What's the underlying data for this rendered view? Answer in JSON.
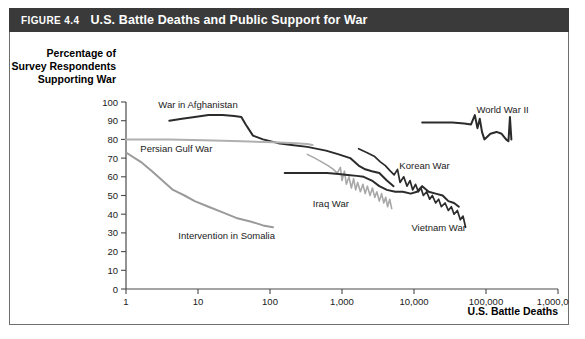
{
  "figure": {
    "number": "FIGURE 4.4",
    "title": "U.S. Battle Deaths and Public Support for War"
  },
  "chart_data": {
    "type": "line",
    "title": "U.S. Battle Deaths and Public Support for War",
    "xlabel": "U.S. Battle Deaths",
    "ylabel": "Percentage of Survey Respondents Supporting War",
    "ylabel_lines": [
      "Percentage of",
      "Survey Respondents",
      "Supporting War"
    ],
    "xscale": "log",
    "xlim": [
      1,
      1000000
    ],
    "ylim": [
      0,
      100
    ],
    "grid": false,
    "legend": "inline-annotations",
    "xticks": [
      1,
      10,
      100,
      1000,
      10000,
      100000,
      1000000
    ],
    "xtick_labels": [
      "1",
      "10",
      "100",
      "1,000",
      "10,000",
      "100,000",
      "1,000,000"
    ],
    "yticks": [
      0,
      10,
      20,
      30,
      40,
      50,
      60,
      70,
      80,
      90,
      100
    ],
    "ytick_labels": [
      "0",
      "10",
      "20",
      "30",
      "40",
      "50",
      "60",
      "70",
      "80",
      "90",
      "100"
    ],
    "series": [
      {
        "name": "War in Afghanistan",
        "color": "#2b2b2b",
        "width": 2.0,
        "label_x": 10,
        "label_y": 97,
        "points": [
          [
            4.0,
            90
          ],
          [
            6.0,
            91
          ],
          [
            9.0,
            92
          ],
          [
            14.0,
            93
          ],
          [
            22.0,
            93
          ],
          [
            32.0,
            92.5
          ],
          [
            40.0,
            92
          ],
          [
            46.0,
            88
          ],
          [
            58.0,
            82
          ],
          [
            80.0,
            80
          ],
          [
            130.0,
            78
          ],
          [
            200.0,
            77
          ],
          [
            330.0,
            76
          ],
          [
            600.0,
            74
          ],
          [
            900.0,
            72
          ],
          [
            1300.0,
            70
          ],
          [
            1700.0,
            66
          ],
          [
            2100.0,
            64
          ],
          [
            2600.0,
            63
          ],
          [
            3300.0,
            62
          ],
          [
            4200.0,
            58
          ],
          [
            5200.0,
            55
          ]
        ]
      },
      {
        "name": "Persian Gulf War",
        "color": "#b0b0b0",
        "width": 2.0,
        "label_x": 5,
        "label_y": 73,
        "points": [
          [
            1.0,
            80
          ],
          [
            4.0,
            80
          ],
          [
            12.0,
            79.5
          ],
          [
            40.0,
            79
          ],
          [
            110.0,
            78.5
          ],
          [
            230.0,
            78
          ],
          [
            330.0,
            77.5
          ],
          [
            390.0,
            77
          ]
        ]
      },
      {
        "name": "Intervention in Somalia",
        "color": "#9a9a9a",
        "width": 2.0,
        "label_x": 25,
        "label_y": 27,
        "points": [
          [
            1.0,
            73
          ],
          [
            1.6,
            68
          ],
          [
            2.3,
            63
          ],
          [
            3.2,
            58
          ],
          [
            4.5,
            53
          ],
          [
            6.5,
            50
          ],
          [
            9.0,
            47
          ],
          [
            14.0,
            44
          ],
          [
            22.0,
            41
          ],
          [
            34.0,
            38
          ],
          [
            55.0,
            36
          ],
          [
            80.0,
            34
          ],
          [
            110.0,
            33
          ]
        ]
      },
      {
        "name": "Iraq War",
        "color": "#a8a8a8",
        "width": 1.6,
        "label_x": 700,
        "label_y": 44,
        "points": [
          [
            330,
            72
          ],
          [
            420,
            70
          ],
          [
            520,
            68
          ],
          [
            640,
            66
          ],
          [
            760,
            64
          ],
          [
            860,
            62
          ],
          [
            950,
            65
          ],
          [
            1000,
            58
          ],
          [
            1080,
            63
          ],
          [
            1150,
            56
          ],
          [
            1250,
            60
          ],
          [
            1350,
            54
          ],
          [
            1450,
            59
          ],
          [
            1550,
            53
          ],
          [
            1650,
            57
          ],
          [
            1800,
            52
          ],
          [
            1950,
            56
          ],
          [
            2100,
            51
          ],
          [
            2250,
            55
          ],
          [
            2450,
            50
          ],
          [
            2650,
            54
          ],
          [
            2850,
            49
          ],
          [
            3050,
            52
          ],
          [
            3300,
            47
          ],
          [
            3550,
            51
          ],
          [
            3800,
            46
          ],
          [
            4050,
            49
          ],
          [
            4300,
            44
          ],
          [
            4600,
            48
          ],
          [
            4900,
            43
          ]
        ]
      },
      {
        "name": "Korean War",
        "color": "#2b2b2b",
        "width": 2.0,
        "label_x": 14000,
        "label_y": 64,
        "points": [
          [
            160,
            62
          ],
          [
            330,
            62
          ],
          [
            620,
            62
          ],
          [
            900,
            61.5
          ],
          [
            1200,
            61
          ],
          [
            1600,
            60.5
          ],
          [
            2000,
            60
          ],
          [
            2600,
            58
          ],
          [
            3300,
            55
          ],
          [
            4200,
            53
          ],
          [
            5500,
            52
          ],
          [
            7000,
            52
          ],
          [
            9000,
            51
          ],
          [
            11000,
            52
          ],
          [
            13000,
            55
          ],
          [
            16000,
            52
          ],
          [
            20000,
            51
          ],
          [
            25000,
            50
          ],
          [
            30000,
            47
          ],
          [
            36000,
            46
          ],
          [
            42000,
            44
          ]
        ]
      },
      {
        "name": "Vietnam War",
        "color": "#2b2b2b",
        "width": 1.7,
        "label_x": 22000,
        "label_y": 31,
        "points": [
          [
            1700,
            75
          ],
          [
            2200,
            73
          ],
          [
            2800,
            71
          ],
          [
            3400,
            68
          ],
          [
            4000,
            66
          ],
          [
            4700,
            63
          ],
          [
            5300,
            61
          ],
          [
            5900,
            64
          ],
          [
            6400,
            57
          ],
          [
            7200,
            60
          ],
          [
            8000,
            55
          ],
          [
            8800,
            58
          ],
          [
            9600,
            53
          ],
          [
            10500,
            56
          ],
          [
            11500,
            52
          ],
          [
            12500,
            54
          ],
          [
            13500,
            50
          ],
          [
            15000,
            52
          ],
          [
            16500,
            48
          ],
          [
            18000,
            50
          ],
          [
            20000,
            46
          ],
          [
            22000,
            48
          ],
          [
            24000,
            44
          ],
          [
            27000,
            46
          ],
          [
            30000,
            42
          ],
          [
            33000,
            44
          ],
          [
            36000,
            40
          ],
          [
            40000,
            42
          ],
          [
            44000,
            37
          ],
          [
            48000,
            39
          ],
          [
            52000,
            33
          ]
        ]
      },
      {
        "name": "World War II",
        "color": "#2b2b2b",
        "width": 2.0,
        "label_x": 170000,
        "label_y": 94,
        "points": [
          [
            13000,
            89
          ],
          [
            22000,
            89
          ],
          [
            34000,
            89
          ],
          [
            50000,
            88.5
          ],
          [
            62000,
            88
          ],
          [
            70000,
            93
          ],
          [
            76000,
            86
          ],
          [
            82000,
            91
          ],
          [
            88000,
            84
          ],
          [
            95000,
            80
          ],
          [
            115000,
            83
          ],
          [
            140000,
            84
          ],
          [
            165000,
            83
          ],
          [
            190000,
            80
          ],
          [
            205000,
            79
          ],
          [
            215000,
            92
          ],
          [
            225000,
            80
          ]
        ]
      }
    ]
  }
}
